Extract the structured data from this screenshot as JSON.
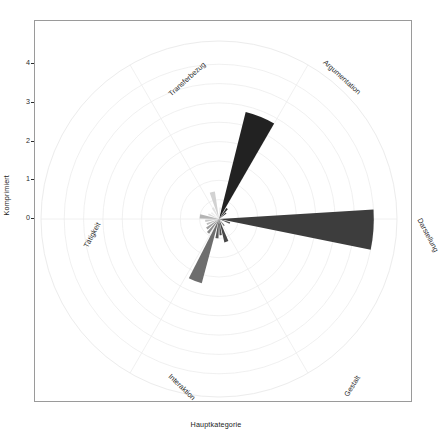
{
  "chart_data": {
    "type": "pie",
    "chart_subtype": "polar-rose-coxcomb",
    "title": "",
    "xlabel": "Hauptkategorie",
    "ylabel": "Komprimiert",
    "grid": true,
    "legend": false,
    "rlim": [
      0,
      4.6
    ],
    "r_ticks": [
      0,
      1,
      2,
      3,
      4
    ],
    "r_tick_labels": [
      "0",
      "1",
      "2",
      "3",
      "4"
    ],
    "angular_axis": {
      "direction": "counterclockwise",
      "zero_at": "east",
      "categories": [
        "Darstellung",
        "Argumentation",
        "Transferbezug",
        "Tätigkeit",
        "Interaktion",
        "Gestalt"
      ],
      "category_angles_deg": [
        0,
        60,
        120,
        180,
        240,
        300
      ]
    },
    "wedges": [
      {
        "label": "Darstellung",
        "angle_center_deg": 356,
        "angle_width_deg": 15,
        "value": 4.0,
        "color": "#3d3d3d"
      },
      {
        "label": "Argumentation",
        "angle_center_deg": 68,
        "angle_width_deg": 16,
        "value": 2.85,
        "color": "#222222"
      },
      {
        "label": "Interaktion",
        "angle_center_deg": 249,
        "angle_width_deg": 12,
        "value": 1.72,
        "color": "#6e6e6e"
      },
      {
        "label": "Gestalt",
        "angle_center_deg": 288,
        "angle_width_deg": 10,
        "value": 0.62,
        "color": "#474747"
      },
      {
        "label": "Transferbezug",
        "angle_center_deg": 104,
        "angle_width_deg": 11,
        "value": 0.72,
        "color": "#d2d2d2"
      },
      {
        "label": "Tätigkeit",
        "angle_center_deg": 172,
        "angle_width_deg": 13,
        "value": 0.5,
        "color": "#b4b4b4"
      },
      {
        "label": "minor-a",
        "angle_center_deg": 84,
        "angle_width_deg": 9,
        "value": 0.3,
        "color": "#ececec"
      },
      {
        "label": "minor-b",
        "angle_center_deg": 119,
        "angle_width_deg": 10,
        "value": 0.33,
        "color": "#e2e2e2"
      },
      {
        "label": "minor-c",
        "angle_center_deg": 140,
        "angle_width_deg": 10,
        "value": 0.26,
        "color": "#ededed"
      },
      {
        "label": "minor-d",
        "angle_center_deg": 156,
        "angle_width_deg": 9,
        "value": 0.3,
        "color": "#dcdcdc"
      },
      {
        "label": "minor-e",
        "angle_center_deg": 188,
        "angle_width_deg": 9,
        "value": 0.36,
        "color": "#c9c9c9"
      },
      {
        "label": "minor-f",
        "angle_center_deg": 203,
        "angle_width_deg": 9,
        "value": 0.34,
        "color": "#bdbdbd"
      },
      {
        "label": "minor-g",
        "angle_center_deg": 218,
        "angle_width_deg": 9,
        "value": 0.4,
        "color": "#9d9d9d"
      },
      {
        "label": "minor-h",
        "angle_center_deg": 232,
        "angle_width_deg": 9,
        "value": 0.46,
        "color": "#8a8a8a"
      },
      {
        "label": "minor-i",
        "angle_center_deg": 264,
        "angle_width_deg": 9,
        "value": 0.5,
        "color": "#595959"
      },
      {
        "label": "minor-j",
        "angle_center_deg": 276,
        "angle_width_deg": 8,
        "value": 0.42,
        "color": "#4f4f4f"
      },
      {
        "label": "minor-k",
        "angle_center_deg": 308,
        "angle_width_deg": 8,
        "value": 0.22,
        "color": "#707070"
      },
      {
        "label": "minor-l",
        "angle_center_deg": 340,
        "angle_width_deg": 8,
        "value": 0.3,
        "color": "#555555"
      },
      {
        "label": "minor-m",
        "angle_center_deg": 52,
        "angle_width_deg": 8,
        "value": 0.34,
        "color": "#2e2e2e"
      },
      {
        "label": "minor-n",
        "angle_center_deg": 40,
        "angle_width_deg": 7,
        "value": 0.24,
        "color": "#3a3a3a"
      }
    ]
  },
  "axes": {
    "y_title": "Komprimiert",
    "x_title": "Hauptkategorie",
    "y_ticks": [
      "0",
      "1",
      "2",
      "3",
      "4"
    ]
  },
  "category_labels": [
    {
      "text": "Transferbezug",
      "rotation_deg": -42,
      "x": 152,
      "y": 58
    },
    {
      "text": "Argumentation",
      "rotation_deg": 42,
      "x": 307,
      "y": 56
    },
    {
      "text": "Darstellung",
      "rotation_deg": 62,
      "x": 393,
      "y": 214
    },
    {
      "text": "Gestalt",
      "rotation_deg": -58,
      "x": 317,
      "y": 365
    },
    {
      "text": "Interaktion",
      "rotation_deg": 44,
      "x": 147,
      "y": 366
    },
    {
      "text": "Tätigkeit",
      "rotation_deg": -62,
      "x": 57,
      "y": 214
    }
  ],
  "style": {
    "grid_color": "#ececec",
    "frame_color": "#9a9a9a",
    "background": "#ffffff",
    "text_color": "#2b2b2b"
  }
}
